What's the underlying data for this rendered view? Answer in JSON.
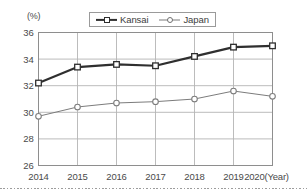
{
  "chart_data": {
    "type": "line",
    "title": "",
    "subtitle": "",
    "xlabel": "(Year)",
    "ylabel": "(%)",
    "x": [
      2014,
      2015,
      2016,
      2017,
      2018,
      2019,
      2020
    ],
    "categories": [
      "2014",
      "2015",
      "2016",
      "2017",
      "2018",
      "2019",
      "2020"
    ],
    "xtick_labels": [
      "2014",
      "2015",
      "2016",
      "2017",
      "2018",
      "2019",
      "2020(Year)"
    ],
    "ytick_labels": [
      "26",
      "28",
      "30",
      "32",
      "34",
      "36"
    ],
    "yticks": [
      26,
      28,
      30,
      32,
      34,
      36
    ],
    "ylim": [
      26,
      36
    ],
    "xlim": [
      2014,
      2020
    ],
    "grid": true,
    "grid_axes": "both",
    "legend_position": "top-center",
    "series": [
      {
        "name": "Kansai",
        "values": [
          32.2,
          33.4,
          33.6,
          33.5,
          34.2,
          34.9,
          35.0
        ],
        "color": "#2f2f2f",
        "line_width": 2.2,
        "marker": "square-open"
      },
      {
        "name": "Japan",
        "values": [
          29.7,
          30.4,
          30.7,
          30.8,
          31.0,
          31.6,
          31.2
        ],
        "color": "#7c7c7c",
        "line_width": 1.0,
        "marker": "circle-open"
      }
    ]
  },
  "legend": {
    "items": [
      {
        "label": "Kansai"
      },
      {
        "label": "Japan"
      }
    ]
  },
  "axes": {
    "y_unit": "(%)",
    "x_unit": "(Year)"
  },
  "colors": {
    "kansai": "#2f2f2f",
    "japan": "#7c7c7c",
    "grid": "#b4b4b4",
    "frame": "#8e8e8e",
    "text": "#4a4a4a",
    "background": "#ffffff"
  }
}
